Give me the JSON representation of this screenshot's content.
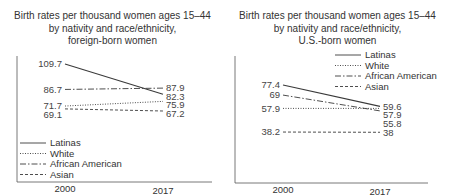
{
  "chart_data": [
    {
      "type": "line",
      "title": "Birth rates per thousand women ages 15–44 by nativity and race/ethnicity, foreign-born women",
      "title_lines": [
        "Birth rates per thousand women ages 15–44",
        "by nativity and race/ethnicity,",
        "foreign-born women"
      ],
      "x": [
        "2000",
        "2017"
      ],
      "xlabel": "",
      "ylabel": "",
      "grid": false,
      "legend": "bottom-left",
      "series": [
        {
          "name": "Latinas",
          "style": "solid",
          "values": [
            109.7,
            82.3
          ],
          "labels": [
            "109.7",
            "82.3"
          ]
        },
        {
          "name": "White",
          "style": "dotted",
          "values": [
            71.7,
            75.9
          ],
          "labels": [
            "71.7",
            "75.9"
          ]
        },
        {
          "name": "African American",
          "style": "dashdot",
          "values": [
            86.7,
            87.9
          ],
          "labels": [
            "86.7",
            "87.9"
          ]
        },
        {
          "name": "Asian",
          "style": "dashed",
          "values": [
            69.1,
            67.2
          ],
          "labels": [
            "69.1",
            "67.2"
          ]
        }
      ]
    },
    {
      "type": "line",
      "title": "Birth rates per thousand women ages 15–44 by nativity and race/ethnicity, U.S.-born women",
      "title_lines": [
        "Birth rates per thousand women ages 15–44",
        "by nativity and race/ethnicity,",
        "U.S.-born women"
      ],
      "x": [
        "2000",
        "2017"
      ],
      "xlabel": "",
      "ylabel": "",
      "grid": false,
      "legend": "top-right",
      "series": [
        {
          "name": "Latinas",
          "style": "solid",
          "values": [
            77.4,
            59.6
          ],
          "labels": [
            "77.4",
            "59.6"
          ]
        },
        {
          "name": "White",
          "style": "dotted",
          "values": [
            57.9,
            57.9
          ],
          "labels": [
            "57.9",
            "57.9"
          ]
        },
        {
          "name": "African American",
          "style": "dashdot",
          "values": [
            69,
            55.8
          ],
          "labels": [
            "69",
            "55.8"
          ]
        },
        {
          "name": "Asian",
          "style": "dashed",
          "values": [
            38.2,
            38
          ],
          "labels": [
            "38.2",
            "38"
          ]
        }
      ]
    }
  ],
  "colors": {
    "line": "#3a3a3a",
    "axis": "#555555",
    "text": "#333333"
  }
}
